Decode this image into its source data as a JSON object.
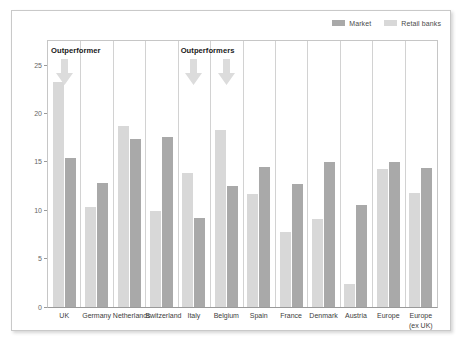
{
  "legend": {
    "entries": [
      {
        "label": "Market",
        "color": "#a9a9a9"
      },
      {
        "label": "Retail banks",
        "color": "#d8d8d8"
      }
    ]
  },
  "annotations": [
    {
      "text": "Outperformer",
      "category": "UK"
    },
    {
      "text": "Outperformers",
      "category": "Italy"
    }
  ],
  "chart_data": {
    "type": "bar",
    "title": "",
    "subtitle": "",
    "xlabel": "",
    "ylabel": "",
    "ylim": [
      0,
      27.5
    ],
    "yticks": [
      0,
      5,
      10,
      15,
      20,
      25
    ],
    "grid": false,
    "legend_position": "top-right",
    "categories": [
      "UK",
      "Germany",
      "Netherlands",
      "Switzerland",
      "Italy",
      "Belgium",
      "Spain",
      "France",
      "Denmark",
      "Austria",
      "Europe",
      "Europe\n(ex UK)"
    ],
    "category_labels": [
      {
        "line1": "UK",
        "line2": ""
      },
      {
        "line1": "Germany",
        "line2": ""
      },
      {
        "line1": "Netherlands",
        "line2": ""
      },
      {
        "line1": "Switzerland",
        "line2": ""
      },
      {
        "line1": "Italy",
        "line2": ""
      },
      {
        "line1": "Belgium",
        "line2": ""
      },
      {
        "line1": "Spain",
        "line2": ""
      },
      {
        "line1": "France",
        "line2": ""
      },
      {
        "line1": "Denmark",
        "line2": ""
      },
      {
        "line1": "Austria",
        "line2": ""
      },
      {
        "line1": "Europe",
        "line2": ""
      },
      {
        "line1": "Europe",
        "line2": "(ex UK)"
      }
    ],
    "series": [
      {
        "name": "Retail banks",
        "color": "#d8d8d8",
        "values": [
          23.3,
          10.3,
          18.7,
          9.9,
          13.9,
          18.3,
          11.7,
          7.8,
          9.1,
          2.4,
          14.3,
          11.8
        ]
      },
      {
        "name": "Market",
        "color": "#a9a9a9",
        "values": [
          15.4,
          12.8,
          17.4,
          17.6,
          9.2,
          12.5,
          14.5,
          12.7,
          15.0,
          10.5,
          15.0,
          14.4
        ]
      }
    ],
    "annotation_arrows": [
      {
        "category": "UK"
      },
      {
        "category": "Italy"
      },
      {
        "category": "Belgium"
      }
    ]
  }
}
